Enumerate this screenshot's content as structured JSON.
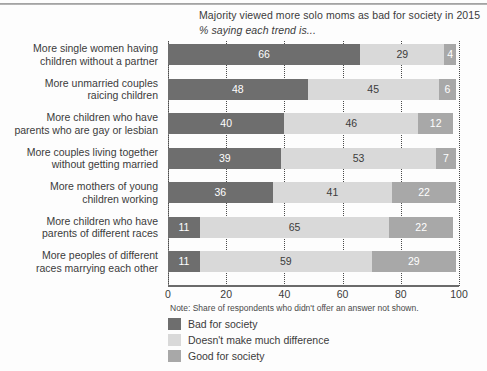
{
  "chart_data": {
    "type": "bar",
    "orientation": "horizontal",
    "stacked": true,
    "title": "Majority viewed more solo moms as bad for society in 2015",
    "subtitle": "% saying each trend is...",
    "note": "Note: Share of respondents who didn't offer an answer not shown.",
    "xlabel": "",
    "ylabel": "",
    "xlim": [
      0,
      100
    ],
    "xticks": [
      0,
      20,
      40,
      60,
      80,
      100
    ],
    "grid": true,
    "legend_position": "bottom-left",
    "categories": [
      "More single women having children without a partner",
      "More unmarried couples raicing children",
      "More children who have parents who are gay or lesbian",
      "More couples living together without getting married",
      "More mothers of young children working",
      "More children who have parents of different races",
      "More peoples of different races marrying each other"
    ],
    "category_lines": [
      [
        "More single women having",
        "children without a partner"
      ],
      [
        "More unmarried couples",
        "raicing children"
      ],
      [
        "More children who have",
        "parents who are gay or lesbian"
      ],
      [
        "More couples living together",
        "without getting married"
      ],
      [
        "More mothers of young",
        "children working"
      ],
      [
        "More children who have",
        "parents of different races"
      ],
      [
        "More peoples of different",
        "races marrying each other"
      ]
    ],
    "series": [
      {
        "name": "Bad for society",
        "color": "#6e6e6e",
        "values": [
          66,
          48,
          40,
          39,
          36,
          11,
          11
        ]
      },
      {
        "name": "Doesn't make much difference",
        "color": "#d9d9d9",
        "values": [
          29,
          45,
          46,
          53,
          41,
          65,
          59
        ]
      },
      {
        "name": "Good for society",
        "color": "#a8a8a8",
        "values": [
          4,
          6,
          12,
          7,
          22,
          22,
          29
        ]
      }
    ]
  },
  "legend": {
    "items": [
      {
        "label": "Bad for society",
        "color": "#6e6e6e"
      },
      {
        "label": "Doesn't make much difference",
        "color": "#d9d9d9"
      },
      {
        "label": "Good for society",
        "color": "#a8a8a8"
      }
    ]
  }
}
